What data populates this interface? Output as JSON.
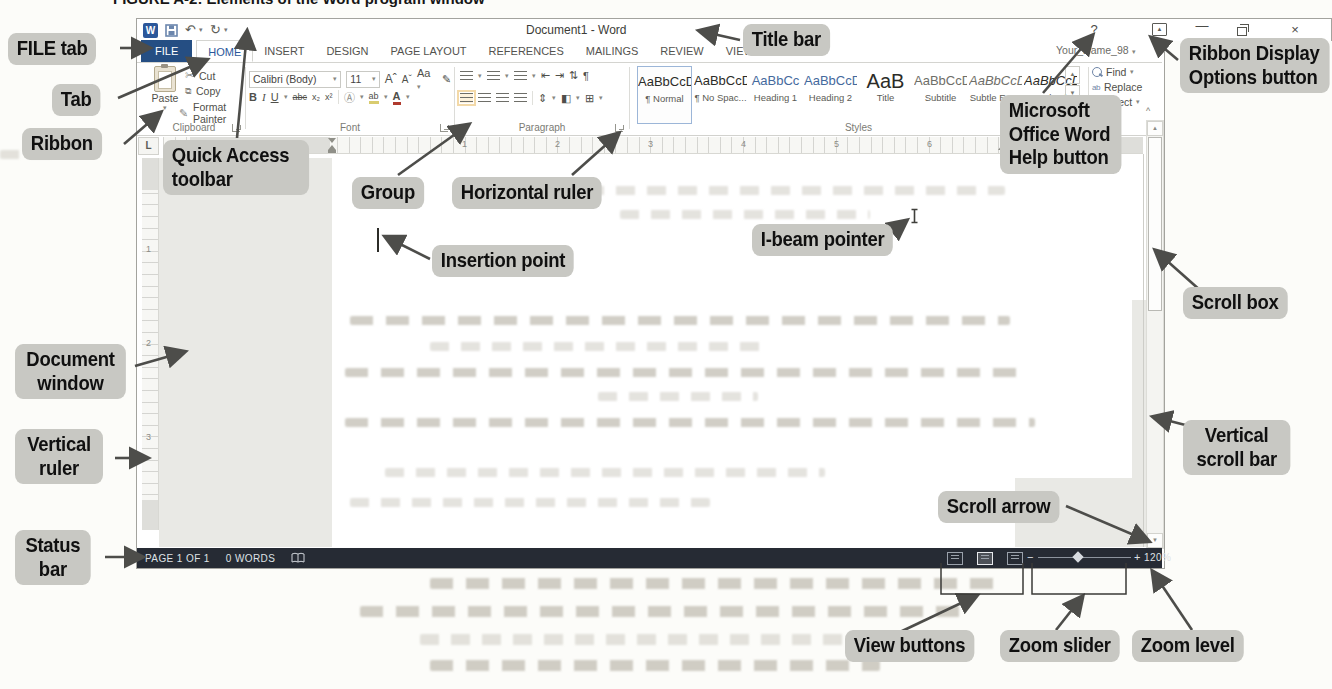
{
  "figure": {
    "caption": "FIGURE A-2: Elements of the Word program window"
  },
  "glyphs": {
    "dropdown": "▾",
    "undo": "↶",
    "redo": "↻",
    "collapse": "^",
    "scroll_up": "▲",
    "scroll_down": "▼"
  },
  "word_window": {
    "title": "Document1 - Word",
    "account": "Your_Name_98",
    "tabs": [
      "FILE",
      "HOME",
      "INSERT",
      "DESIGN",
      "PAGE LAYOUT",
      "REFERENCES",
      "MAILINGS",
      "REVIEW",
      "VIEW"
    ],
    "window_controls": {
      "help": "?",
      "minimize": "—",
      "close": "×"
    },
    "ribbon": {
      "clipboard": {
        "group_label": "Clipboard",
        "paste": "Paste",
        "cut": "Cut",
        "copy": "Copy",
        "format_painter": "Format Painter"
      },
      "font": {
        "group_label": "Font",
        "font_name": "Calibri (Body)",
        "font_size": "11",
        "grow": "A",
        "shrink": "A",
        "change_case": "Aa",
        "bold": "B",
        "italic": "I",
        "underline": "U",
        "strikethrough": "abc",
        "subscript": "x₂",
        "superscript": "x²",
        "outline": "A",
        "highlight": "ab",
        "font_color": "A"
      },
      "paragraph": {
        "group_label": "Paragraph",
        "pilcrow": "¶"
      },
      "styles": {
        "group_label": "Styles",
        "items": [
          {
            "preview": "AaBbCcDc",
            "name": "¶ Normal"
          },
          {
            "preview": "AaBbCcDc",
            "name": "¶ No Spac..."
          },
          {
            "preview": "AaBbCc",
            "name": "Heading 1"
          },
          {
            "preview": "AaBbCcD",
            "name": "Heading 2"
          },
          {
            "preview": "AaB",
            "name": "Title"
          },
          {
            "preview": "AaBbCcD",
            "name": "Subtitle"
          },
          {
            "preview": "AaBbCcDi",
            "name": "Subtle Em..."
          },
          {
            "preview": "AaBbCcDi",
            "name": "Emphasis"
          }
        ]
      },
      "editing": {
        "find": "Find",
        "replace": "Replace",
        "select": "Select"
      }
    },
    "tab_selector": "L",
    "ruler_h_numbers": [
      "1",
      "2",
      "3",
      "4",
      "5",
      "6",
      "7"
    ],
    "ruler_v_numbers": [
      "1",
      "2",
      "3"
    ],
    "status_bar": {
      "page_info": "PAGE 1 OF 1",
      "word_count": "0 WORDS",
      "zoom_minus": "−",
      "zoom_plus": "+",
      "zoom_level": "120%"
    }
  },
  "callouts": [
    {
      "text": "FILE tab"
    },
    {
      "text": "Tab"
    },
    {
      "text": "Ribbon"
    },
    {
      "text": "Quick Access toolbar"
    },
    {
      "text": "Group"
    },
    {
      "text": "Horizontal ruler"
    },
    {
      "text": "Title bar"
    },
    {
      "text": "Ribbon Display Options button"
    },
    {
      "text": "Microsoft Office Word Help button"
    },
    {
      "text": "I-beam pointer"
    },
    {
      "text": "Insertion point"
    },
    {
      "text": "Scroll box"
    },
    {
      "text": "Document window"
    },
    {
      "text": "Vertical ruler"
    },
    {
      "text": "Vertical scroll bar"
    },
    {
      "text": "Scroll arrow"
    },
    {
      "text": "Status bar"
    },
    {
      "text": "View buttons"
    },
    {
      "text": "Zoom slider"
    },
    {
      "text": "Zoom level"
    }
  ],
  "colors": {
    "file_tab": "#254e83",
    "status_bar": "#262b34",
    "callout_bg": "#c8c8c3",
    "heading_style": "#44699d"
  }
}
